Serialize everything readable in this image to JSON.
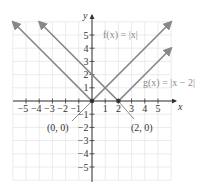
{
  "chart_data": {
    "type": "line",
    "title": "",
    "xlabel": "x",
    "ylabel": "y",
    "xlim": [
      -6,
      6
    ],
    "ylim": [
      -6,
      6
    ],
    "grid": true,
    "x_ticks": [
      -5,
      -4,
      -3,
      -2,
      -1,
      1,
      2,
      3,
      4,
      5
    ],
    "y_ticks": [
      -5,
      -4,
      -3,
      -2,
      -1,
      1,
      2,
      3,
      4,
      5
    ],
    "x_tick_labels": [
      "−5",
      "−4",
      "−3",
      "−2",
      "−1",
      "1",
      "2",
      "3",
      "4",
      "5"
    ],
    "y_tick_labels": [
      "−5",
      "−4",
      "−3",
      "−2",
      "−1",
      "1",
      "2",
      "3",
      "4",
      "5"
    ],
    "series": [
      {
        "name": "f(x) = |x|",
        "label": "f(x) = |x|",
        "color": "#888888",
        "points": [
          [
            -6,
            6
          ],
          [
            0,
            0
          ],
          [
            6,
            6
          ]
        ]
      },
      {
        "name": "g(x) = |x − 2|",
        "label": "g(x) = |x − 2|",
        "color": "#888888",
        "points": [
          [
            -4,
            6
          ],
          [
            2,
            0
          ],
          [
            6,
            4
          ]
        ]
      }
    ],
    "annotations": [
      {
        "text": "(0, 0)",
        "point": [
          0,
          0
        ]
      },
      {
        "text": "(2, 0)",
        "point": [
          2,
          0
        ]
      }
    ]
  },
  "labels": {
    "x_axis": "x",
    "y_axis": "y",
    "f_label": "f(x) = |x|",
    "g_label": "g(x) = |x − 2|",
    "vertex_f": "(0, 0)",
    "vertex_g": "(2, 0)"
  },
  "colors": {
    "curve": "#888888",
    "axis": "#333333",
    "grid": "#e6e6e6",
    "vertex_dot": "#333333"
  }
}
